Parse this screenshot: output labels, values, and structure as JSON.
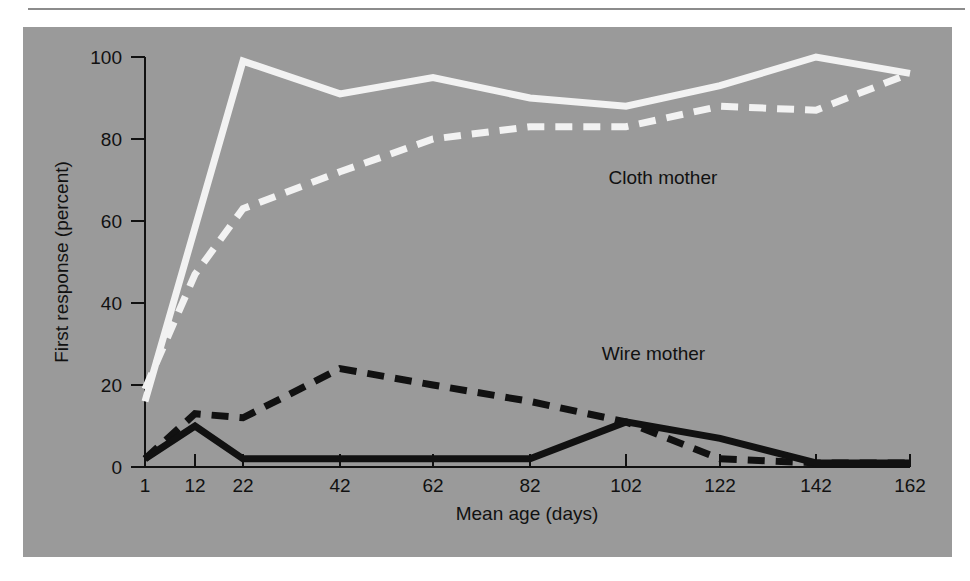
{
  "chart_data": {
    "type": "line",
    "title": "",
    "xlabel": "Mean age (days)",
    "ylabel": "First response (percent)",
    "x": [
      1,
      12,
      22,
      42,
      62,
      82,
      102,
      122,
      142,
      162
    ],
    "xtick_labels": [
      "1",
      "12",
      "22",
      "42",
      "62",
      "82",
      "102",
      "122",
      "142",
      "162"
    ],
    "ytick_labels": [
      "0",
      "20",
      "40",
      "60",
      "80",
      "100"
    ],
    "ytick_values": [
      0,
      20,
      40,
      60,
      80,
      100
    ],
    "xlim": [
      1,
      162
    ],
    "ylim": [
      0,
      100
    ],
    "grid": false,
    "legend_position": "inline-annotation",
    "annotations": [
      {
        "text": "Cloth mother",
        "x": 110,
        "y": 69
      },
      {
        "text": "Wire mother",
        "x": 108,
        "y": 26
      }
    ],
    "series": [
      {
        "name": "Cloth mother (solid)",
        "color": "#f2f2f2",
        "style": "solid",
        "x": [
          1,
          22,
          42,
          62,
          82,
          102,
          122,
          142,
          162
        ],
        "values": [
          16,
          99,
          91,
          95,
          90,
          88,
          93,
          100,
          96
        ]
      },
      {
        "name": "Cloth mother (dashed)",
        "color": "#f2f2f2",
        "style": "dashed",
        "x": [
          1,
          12,
          22,
          42,
          62,
          82,
          102,
          122,
          142,
          162
        ],
        "values": [
          19,
          47,
          63,
          72,
          80,
          83,
          83,
          88,
          87,
          96
        ]
      },
      {
        "name": "Wire mother (dashed)",
        "color": "#111111",
        "style": "dashed",
        "x": [
          1,
          12,
          22,
          42,
          62,
          82,
          102,
          122,
          142,
          162
        ],
        "values": [
          2,
          13,
          12,
          24,
          20,
          16,
          11,
          2,
          1,
          1
        ]
      },
      {
        "name": "Wire mother (solid)",
        "color": "#111111",
        "style": "solid",
        "x": [
          1,
          12,
          22,
          42,
          62,
          82,
          102,
          122,
          142,
          162
        ],
        "values": [
          2,
          10,
          2,
          2,
          2,
          2,
          11,
          7,
          1,
          1
        ]
      }
    ]
  },
  "axes": {
    "x_title": "Mean age (days)",
    "y_title": "First response (percent)"
  }
}
